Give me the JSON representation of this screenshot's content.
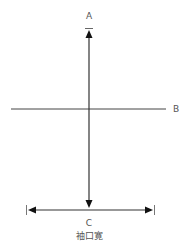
{
  "diagram": {
    "labels": {
      "top": "A",
      "right": "B",
      "bottom": "C",
      "caption": "袖口寛"
    },
    "colors": {
      "line": "#333333",
      "text": "#555555",
      "background": "#ffffff"
    }
  }
}
